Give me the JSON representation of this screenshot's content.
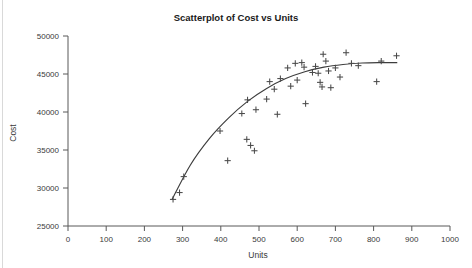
{
  "chart_data": {
    "type": "scatter",
    "title": "Scatterplot of Cost vs Units",
    "xlabel": "Units",
    "ylabel": "Cost",
    "xlim": [
      0,
      1000
    ],
    "ylim": [
      25000,
      50000
    ],
    "xticks": [
      0,
      100,
      200,
      300,
      400,
      500,
      600,
      700,
      800,
      900,
      1000
    ],
    "yticks": [
      25000,
      30000,
      35000,
      40000,
      45000,
      50000
    ],
    "grid": false,
    "legend": null,
    "marker": "plus",
    "marker_color": "#4a4a4a",
    "trendline_color": "#3d3d3d",
    "series": [
      {
        "name": "Cost vs Units",
        "points": [
          [
            275,
            28500
          ],
          [
            292,
            29400
          ],
          [
            303,
            31500
          ],
          [
            398,
            37500
          ],
          [
            418,
            33600
          ],
          [
            455,
            39800
          ],
          [
            468,
            36400
          ],
          [
            470,
            41600
          ],
          [
            478,
            35600
          ],
          [
            488,
            34900
          ],
          [
            492,
            40300
          ],
          [
            520,
            41700
          ],
          [
            528,
            44000
          ],
          [
            540,
            43000
          ],
          [
            548,
            39700
          ],
          [
            556,
            44400
          ],
          [
            575,
            45800
          ],
          [
            583,
            43400
          ],
          [
            595,
            46400
          ],
          [
            600,
            44200
          ],
          [
            612,
            46500
          ],
          [
            618,
            45900
          ],
          [
            622,
            41100
          ],
          [
            640,
            45200
          ],
          [
            648,
            46000
          ],
          [
            655,
            45100
          ],
          [
            660,
            43900
          ],
          [
            665,
            43300
          ],
          [
            668,
            47600
          ],
          [
            675,
            46700
          ],
          [
            682,
            45400
          ],
          [
            688,
            43200
          ],
          [
            700,
            45800
          ],
          [
            712,
            44600
          ],
          [
            728,
            47800
          ],
          [
            742,
            46400
          ],
          [
            760,
            46100
          ],
          [
            808,
            44000
          ],
          [
            820,
            46700
          ],
          [
            860,
            47400
          ]
        ]
      }
    ],
    "trendline": {
      "type": "fitted-curve",
      "points": [
        [
          272,
          28450
        ],
        [
          320,
          33000
        ],
        [
          370,
          36500
        ],
        [
          420,
          39200
        ],
        [
          470,
          41400
        ],
        [
          520,
          43100
        ],
        [
          570,
          44400
        ],
        [
          620,
          45300
        ],
        [
          670,
          45900
        ],
        [
          720,
          46250
        ],
        [
          770,
          46450
        ],
        [
          820,
          46500
        ],
        [
          862,
          46500
        ]
      ]
    }
  }
}
